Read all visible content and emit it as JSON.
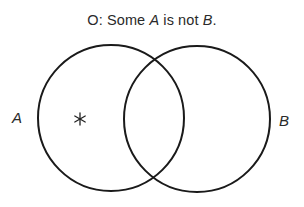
{
  "diagram": {
    "title": {
      "prefix": "O:  Some ",
      "term_a": "A",
      "middle": " is not ",
      "term_b": "B",
      "suffix": "."
    },
    "circles": [
      {
        "label": "A",
        "cx": 111,
        "cy": 118,
        "r": 73
      },
      {
        "label": "B",
        "cx": 197,
        "cy": 119,
        "r": 73
      }
    ],
    "marker": {
      "symbol": "*",
      "region": "A only",
      "x": 80,
      "y": 119
    },
    "stroke_color": "#1a1a1a"
  }
}
